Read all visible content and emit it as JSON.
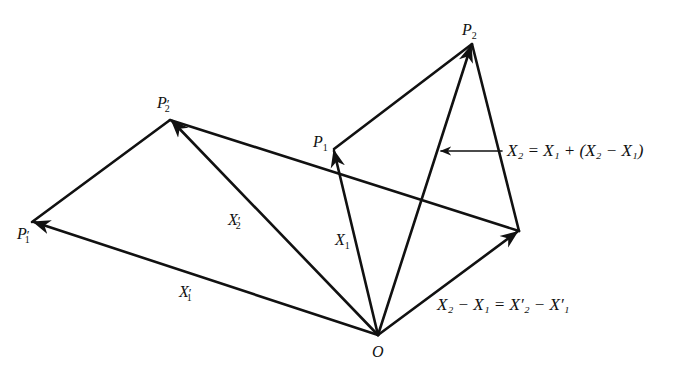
{
  "diagram": {
    "stroke_color": "#111111",
    "points": {
      "O": {
        "x": 378,
        "y": 335,
        "label": "O"
      },
      "P1": {
        "x": 334,
        "y": 149,
        "label": "P1"
      },
      "P2": {
        "x": 472,
        "y": 44,
        "label": "P2"
      },
      "P1p": {
        "x": 32,
        "y": 222,
        "label": "P'1"
      },
      "P2p": {
        "x": 170,
        "y": 120,
        "label": "P'2"
      },
      "Q": {
        "x": 519,
        "y": 231
      }
    },
    "labels": {
      "O": "O",
      "P1": "P",
      "P1_sub": "1",
      "P2": "P",
      "P2_sub": "2",
      "P1p": "P",
      "P1p_sub": "1",
      "P2p": "P",
      "P2p_sub": "2",
      "prime": "′",
      "X1": "X",
      "X1_sub": "1",
      "X1p": "X",
      "X1p_sub": "1",
      "X2p": "X",
      "X2p_sub": "2",
      "eq_top": "X₂ = X₁ + (X₂ − X₁)",
      "eq_bottom": "X₂ − X₁ = X′₂ − X′₁"
    }
  }
}
